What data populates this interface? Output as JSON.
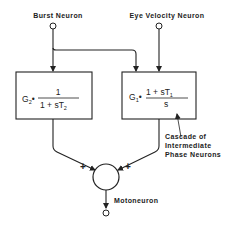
{
  "diagram": {
    "inputs": {
      "burst_neuron": "Burst Neuron",
      "eye_velocity_neuron": "Eye Velocity Neuron"
    },
    "left_block": {
      "gain": "G",
      "gain_sub": "2",
      "numerator": "1",
      "denominator_prefix": "1 + sT",
      "denominator_sub": "2"
    },
    "right_block": {
      "gain": "G",
      "gain_sub": "1",
      "numerator_prefix": "1 + sT",
      "numerator_sub": "1",
      "denominator": "s"
    },
    "annotation": {
      "line1": "Cascade of",
      "line2": "Intermediate",
      "line3": "Phase Neurons"
    },
    "summation": {
      "left_sign": "+",
      "right_sign": "+"
    },
    "output": {
      "label": "Motoneuron"
    }
  }
}
